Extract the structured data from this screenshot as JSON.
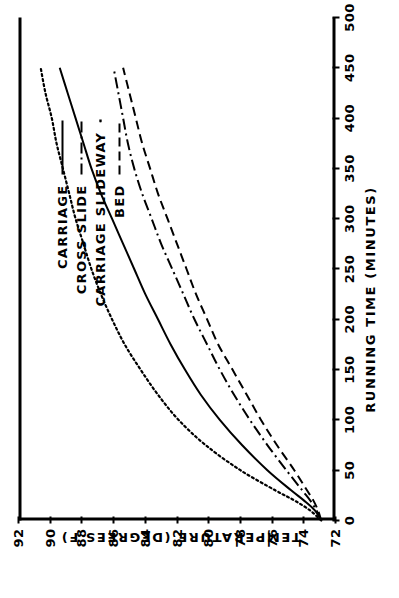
{
  "chart_data": {
    "type": "line",
    "title": "",
    "xlabel": "RUNNING TIME (MINUTES)",
    "ylabel": "TEMPERATURE (DEGREES F)",
    "xlim": [
      0,
      500
    ],
    "ylim": [
      72,
      92
    ],
    "xticks": [
      0,
      50,
      100,
      150,
      200,
      250,
      300,
      350,
      400,
      450,
      500
    ],
    "yticks": [
      72,
      74,
      76,
      78,
      80,
      82,
      84,
      86,
      88,
      90,
      92
    ],
    "xtick_labels": [
      "0",
      "50",
      "100",
      "150",
      "200",
      "250",
      "300",
      "350",
      "400",
      "450",
      "500"
    ],
    "ytick_labels": [
      "72",
      "74",
      "76",
      "78",
      "80",
      "82",
      "84",
      "86",
      "88",
      "90",
      "92"
    ],
    "grid": false,
    "legend_position": "upper right inside",
    "line_color": "#000000",
    "series": [
      {
        "name": "CARRIAGE",
        "style": "solid",
        "x": [
          0,
          10,
          20,
          30,
          50,
          75,
          100,
          125,
          150,
          175,
          200,
          225,
          250,
          275,
          300,
          325,
          350,
          375,
          400,
          425,
          450
        ],
        "y": [
          72.9,
          73.3,
          74.0,
          74.8,
          76.3,
          77.9,
          79.3,
          80.5,
          81.5,
          82.4,
          83.2,
          84.0,
          84.7,
          85.4,
          86.1,
          86.8,
          87.4,
          87.9,
          88.4,
          88.9,
          89.4
        ]
      },
      {
        "name": "CROSS SLIDE",
        "style": "dashdot",
        "x": [
          0,
          10,
          20,
          30,
          50,
          75,
          100,
          125,
          150,
          175,
          200,
          225,
          250,
          275,
          300,
          325,
          350,
          375,
          400,
          425,
          450
        ],
        "y": [
          72.9,
          73.2,
          73.6,
          74.1,
          75.1,
          76.3,
          77.4,
          78.4,
          79.3,
          80.1,
          80.9,
          81.6,
          82.3,
          83.0,
          83.6,
          84.2,
          84.7,
          85.1,
          85.4,
          85.7,
          86.0
        ]
      },
      {
        "name": "CARRIAGE SLIDEWAY",
        "style": "dotted",
        "x": [
          0,
          10,
          20,
          30,
          50,
          75,
          100,
          125,
          150,
          175,
          200,
          225,
          250,
          275,
          300,
          325,
          350,
          375,
          400,
          425,
          450
        ],
        "y": [
          72.9,
          73.6,
          74.6,
          75.8,
          78.0,
          80.2,
          81.9,
          83.2,
          84.3,
          85.3,
          86.1,
          86.8,
          87.4,
          87.9,
          88.4,
          88.8,
          89.2,
          89.6,
          89.9,
          90.3,
          90.6
        ]
      },
      {
        "name": "BED",
        "style": "dashed",
        "x": [
          0,
          10,
          20,
          30,
          50,
          75,
          100,
          125,
          150,
          175,
          200,
          225,
          250,
          275,
          300,
          325,
          350,
          375,
          400,
          425,
          450
        ],
        "y": [
          72.9,
          73.1,
          73.4,
          73.8,
          74.6,
          75.7,
          76.7,
          77.6,
          78.5,
          79.4,
          80.1,
          80.8,
          81.4,
          82.0,
          82.6,
          83.2,
          83.7,
          84.2,
          84.6,
          85.0,
          85.4
        ]
      }
    ]
  },
  "legend": {
    "items": [
      {
        "label": "CARRIAGE",
        "style": "solid"
      },
      {
        "label": "CROSS SLIDE",
        "style": "dashdot"
      },
      {
        "label": "CARRIAGE SLIDEWAY",
        "style": "dotted"
      },
      {
        "label": "BED",
        "style": "dashed"
      }
    ]
  }
}
